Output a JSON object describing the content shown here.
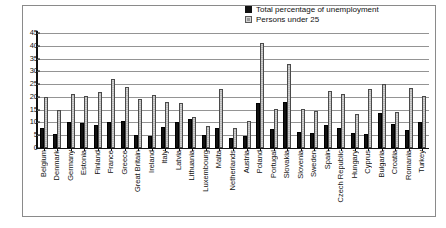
{
  "chart_data": {
    "type": "bar",
    "title": "",
    "subtitle": "",
    "xlabel": "",
    "ylabel": "",
    "ylim": [
      0,
      45
    ],
    "ytick_values": [
      0,
      5,
      10,
      15,
      20,
      25,
      30,
      35,
      40,
      45
    ],
    "ytick_labels": [
      "0",
      "5",
      "10",
      "15",
      "20",
      "25",
      "30",
      "35",
      "40",
      "45"
    ],
    "grid": true,
    "legend_position": "top-right",
    "colors": {
      "total_percentage_of_unemployment": "#111111",
      "persons_under_25": "#c4c4c4",
      "gridline": "#949494",
      "axis": "#111111",
      "frame": "#8a8a8a",
      "background": "#ffffff"
    },
    "categories": [
      "Belgium",
      "Denmark",
      "Germany",
      "Estonia",
      "Finland",
      "France",
      "Greece",
      "Great Britain",
      "Ireland",
      "Italy",
      "Latvia",
      "Lithuania",
      "Luxembourg",
      "Malta",
      "Netherlands",
      "Austria",
      "Poland",
      "Portugal",
      "Slovakia",
      "Slovenia",
      "Sweden",
      "Spain",
      "Czech Republic",
      "Hungary",
      "Cyprus",
      "Bulgaria",
      "Croatia",
      "Romania",
      "Turkey"
    ],
    "series": [
      {
        "name": "Total percentage of unemployment",
        "color": "#111111",
        "values": [
          8.0,
          5.5,
          10.0,
          9.8,
          9.0,
          10.2,
          10.6,
          5.0,
          4.6,
          8.2,
          10.0,
          11.3,
          5.0,
          7.7,
          4.0,
          4.8,
          17.5,
          7.6,
          18.0,
          6.3,
          6.0,
          9.2,
          8.0,
          6.0,
          5.3,
          13.7,
          9.5,
          7.2,
          10.3
        ]
      },
      {
        "name": "Persons under 25",
        "color": "#c4c4c4",
        "values": [
          20.1,
          15.0,
          21.0,
          20.4,
          21.8,
          27.1,
          23.7,
          19.2,
          20.7,
          18.2,
          17.5,
          12.3,
          8.5,
          23.1,
          8.0,
          10.5,
          41.0,
          15.4,
          33.0,
          15.1,
          14.6,
          22.4,
          21.3,
          13.5,
          23.0,
          25.0,
          14.1,
          23.6,
          20.4
        ]
      }
    ]
  },
  "legend": {
    "items": [
      {
        "label": "Total percentage of unemployment",
        "swatch": "black-square-icon"
      },
      {
        "label": "Persons under 25",
        "swatch": "gray-square-icon"
      }
    ]
  }
}
